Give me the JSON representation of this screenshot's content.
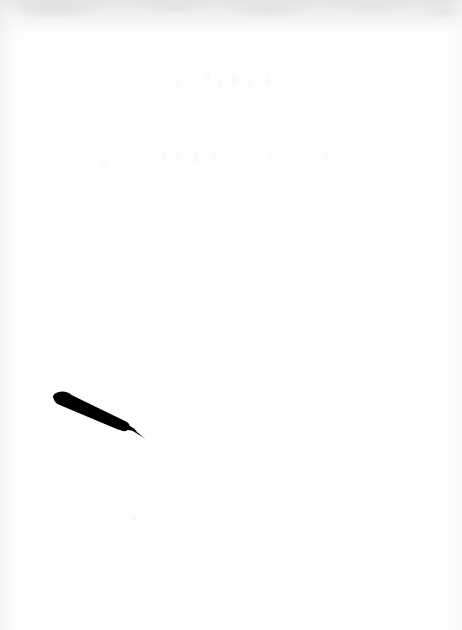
{
  "document": {
    "kind": "scanned-page",
    "page_background_color": "#fefefe",
    "ink_color": "#000000",
    "width_px": 462,
    "height_px": 630
  },
  "scan_artifacts": {
    "top_edge_shadow": "visible grey mottled band across the top edge",
    "left_margin_shadow": "faint grey vignette along the left margin",
    "right_margin_shadow": "very faint grey wash near the right edge",
    "shadow_color": "#e2e2e4"
  },
  "ghost_text": {
    "note": "two lines of extremely faint, washed-out handwriting; no characters are legible",
    "legible": false,
    "ink_color": "#fcfcfc",
    "lines": [
      {
        "id": "ghost-line-1",
        "transcription": "",
        "x": 168,
        "y": 68,
        "width": 122,
        "height": 30
      },
      {
        "id": "ghost-line-2",
        "transcription": "",
        "x": 98,
        "y": 143,
        "width": 244,
        "height": 33
      }
    ]
  },
  "pen": {
    "label": "pen",
    "color": "#000000",
    "description": "solid black pen lying diagonally, blunt rounded end at upper-left, tapering to a fine nib point at lower-right",
    "blunt_end": {
      "x": 57,
      "y": 396
    },
    "nib_tip": {
      "x": 142,
      "y": 437
    },
    "body_thickness_px": 12,
    "angle_deg": 25
  },
  "speck": {
    "label": "stray speck",
    "x": 132,
    "y": 517,
    "size_px": 3
  }
}
